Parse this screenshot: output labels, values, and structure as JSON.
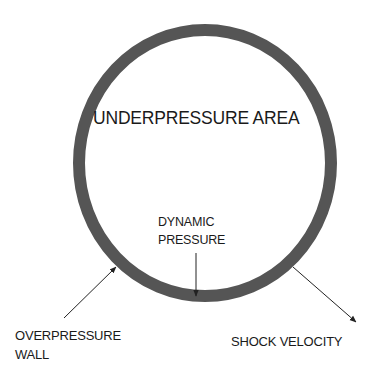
{
  "diagram": {
    "type": "blast-wave-schematic",
    "colors": {
      "background": "#ffffff",
      "wall": "#555555",
      "arrow": "#222222",
      "text": "#1a1a1a"
    },
    "circle": {
      "cx": 205,
      "cy": 163,
      "rx": 126,
      "ry": 133,
      "stroke_width": 12
    },
    "labels": {
      "underpressure_area": "UNDERPRESSURE AREA",
      "dynamic_pressure_line1": "DYNAMIC",
      "dynamic_pressure_line2": "PRESSURE",
      "overpressure_wall_line1": "OVERPRESSURE",
      "overpressure_wall_line2": "WALL",
      "shock_velocity": "SHOCK VELOCITY"
    },
    "arrows": [
      {
        "name": "dynamic-pressure-arrow",
        "from": [
          196,
          253
        ],
        "to": [
          196,
          297
        ]
      },
      {
        "name": "overpressure-wall-arrow",
        "from": [
          64,
          318
        ],
        "to": [
          117,
          266
        ]
      },
      {
        "name": "shock-velocity-arrow",
        "from": [
          293,
          267
        ],
        "to": [
          357,
          323
        ]
      }
    ]
  }
}
